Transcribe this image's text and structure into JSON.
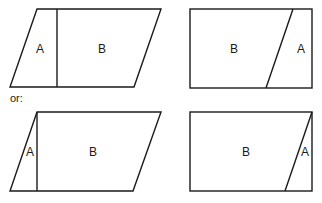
{
  "separator_text": "or:",
  "figures": [
    {
      "id": "parallelogram-top",
      "region_labels": {
        "a": "A",
        "b": "B"
      }
    },
    {
      "id": "rectangle-top",
      "region_labels": {
        "a": "A",
        "b": "B"
      }
    },
    {
      "id": "parallelogram-bottom",
      "region_labels": {
        "a": "A",
        "b": "B"
      }
    },
    {
      "id": "rectangle-bottom",
      "region_labels": {
        "a": "A",
        "b": "B"
      }
    }
  ],
  "colors": {
    "stroke": "#1a1a1a",
    "background": "#ffffff"
  }
}
